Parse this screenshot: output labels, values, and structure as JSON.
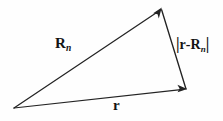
{
  "figure": {
    "type": "vector-triangle-diagram",
    "background_color": "#fefefe",
    "line_color": "#232323",
    "text_color": "#141414",
    "labels": {
      "position_vector_Rn": {
        "symbol": "R",
        "subscript": "n",
        "full_text": "R_n"
      },
      "difference_vector": {
        "open_bar": "|",
        "symbol_r": "r",
        "operator": "-",
        "symbol_R": "R",
        "subscript": "n",
        "close_bar": "|",
        "full_text": "|r-R_n|"
      },
      "position_vector_r": {
        "symbol": "r",
        "full_text": "r"
      }
    },
    "geometry": {
      "origin": {
        "x": 14,
        "y": 108
      },
      "apex": {
        "x": 161,
        "y": 9
      },
      "right_vertex": {
        "x": 186,
        "y": 89
      },
      "edges": [
        {
          "name": "R_n",
          "from": "origin",
          "to": "apex",
          "arrowhead": "at-apex"
        },
        {
          "name": "r",
          "from": "origin",
          "to": "right_vertex",
          "arrowhead": "at-right-vertex"
        },
        {
          "name": "|r-R_n|",
          "from": "apex",
          "to": "right_vertex",
          "arrowhead": "none"
        }
      ]
    }
  }
}
